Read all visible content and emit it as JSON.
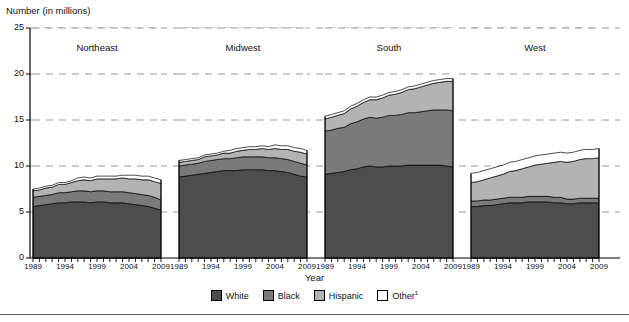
{
  "axes": {
    "ylabel": "Number (in millions)",
    "xlabel": "Year",
    "yticks": [
      "0",
      "5",
      "10",
      "15",
      "20",
      "25"
    ]
  },
  "legend": {
    "items": [
      {
        "label": "White",
        "color": "#4d4d4d",
        "sup": ""
      },
      {
        "label": "Black",
        "color": "#7a7a7a",
        "sup": ""
      },
      {
        "label": "Hispanic",
        "color": "#b3b3b3",
        "sup": ""
      },
      {
        "label": "Other",
        "color": "#ffffff",
        "sup": "1"
      }
    ]
  },
  "chart_data": {
    "type": "area",
    "title": "",
    "subtitle": "",
    "xlabel": "Year",
    "ylabel": "Number (in millions)",
    "ylim": [
      0,
      25
    ],
    "yticks": [
      0,
      5,
      10,
      15,
      20,
      25
    ],
    "grid": true,
    "grid_style": "dashed-horizontal",
    "legend_position": "bottom-center",
    "stacked": true,
    "series_order": [
      "White",
      "Black",
      "Hispanic",
      "Other"
    ],
    "x": [
      1989,
      1990,
      1991,
      1992,
      1993,
      1994,
      1995,
      1996,
      1997,
      1998,
      1999,
      2000,
      2001,
      2002,
      2003,
      2004,
      2005,
      2006,
      2007,
      2008,
      2009
    ],
    "xtick_labels": [
      "1989",
      "1994",
      "1999",
      "2004",
      "2009"
    ],
    "panels": [
      {
        "name": "Northeast",
        "series": [
          {
            "name": "White",
            "values": [
              5.6,
              5.7,
              5.8,
              5.9,
              6.0,
              6.0,
              6.1,
              6.1,
              6.1,
              6.0,
              6.1,
              6.1,
              6.0,
              6.0,
              6.0,
              5.9,
              5.8,
              5.7,
              5.6,
              5.4,
              5.2
            ]
          },
          {
            "name": "Black",
            "values": [
              1.0,
              1.0,
              1.0,
              1.0,
              1.1,
              1.1,
              1.1,
              1.2,
              1.2,
              1.2,
              1.2,
              1.2,
              1.2,
              1.2,
              1.2,
              1.2,
              1.2,
              1.2,
              1.2,
              1.2,
              1.1
            ]
          },
          {
            "name": "Hispanic",
            "values": [
              0.7,
              0.7,
              0.8,
              0.8,
              0.9,
              0.9,
              1.0,
              1.1,
              1.2,
              1.2,
              1.3,
              1.3,
              1.4,
              1.4,
              1.5,
              1.5,
              1.6,
              1.6,
              1.7,
              1.7,
              1.8
            ]
          },
          {
            "name": "Other",
            "values": [
              0.2,
              0.2,
              0.2,
              0.2,
              0.2,
              0.2,
              0.2,
              0.3,
              0.3,
              0.3,
              0.3,
              0.3,
              0.3,
              0.3,
              0.3,
              0.4,
              0.4,
              0.4,
              0.4,
              0.4,
              0.4
            ]
          }
        ],
        "totals": [
          7.5,
          7.6,
          7.8,
          7.9,
          8.2,
          8.2,
          8.4,
          8.7,
          8.8,
          8.7,
          8.9,
          8.9,
          8.9,
          8.9,
          9.0,
          9.0,
          9.0,
          8.9,
          8.9,
          8.7,
          8.5
        ]
      },
      {
        "name": "Midwest",
        "series": [
          {
            "name": "White",
            "values": [
              8.8,
              8.9,
              9.0,
              9.1,
              9.2,
              9.3,
              9.4,
              9.5,
              9.5,
              9.5,
              9.6,
              9.6,
              9.6,
              9.6,
              9.5,
              9.5,
              9.4,
              9.3,
              9.1,
              8.9,
              8.8
            ]
          },
          {
            "name": "Black",
            "values": [
              1.2,
              1.2,
              1.2,
              1.2,
              1.3,
              1.3,
              1.3,
              1.3,
              1.3,
              1.4,
              1.4,
              1.4,
              1.4,
              1.4,
              1.4,
              1.4,
              1.4,
              1.4,
              1.4,
              1.4,
              1.3
            ]
          },
          {
            "name": "Hispanic",
            "values": [
              0.4,
              0.4,
              0.4,
              0.4,
              0.5,
              0.5,
              0.5,
              0.6,
              0.6,
              0.7,
              0.7,
              0.8,
              0.8,
              0.9,
              0.9,
              1.0,
              1.0,
              1.1,
              1.1,
              1.2,
              1.2
            ]
          },
          {
            "name": "Other",
            "values": [
              0.2,
              0.2,
              0.2,
              0.2,
              0.2,
              0.2,
              0.2,
              0.2,
              0.3,
              0.3,
              0.3,
              0.3,
              0.3,
              0.3,
              0.3,
              0.4,
              0.4,
              0.4,
              0.4,
              0.4,
              0.4
            ]
          }
        ],
        "totals": [
          10.6,
          10.7,
          10.8,
          10.9,
          11.2,
          11.3,
          11.4,
          11.6,
          11.7,
          11.9,
          12.0,
          12.1,
          12.1,
          12.2,
          12.1,
          12.3,
          12.2,
          12.2,
          12.0,
          11.9,
          11.7
        ]
      },
      {
        "name": "South",
        "series": [
          {
            "name": "White",
            "values": [
              9.1,
              9.2,
              9.3,
              9.4,
              9.6,
              9.7,
              9.9,
              10.0,
              9.9,
              9.9,
              10.0,
              10.0,
              10.0,
              10.1,
              10.1,
              10.1,
              10.1,
              10.1,
              10.1,
              10.0,
              9.9
            ]
          },
          {
            "name": "Black",
            "values": [
              4.7,
              4.7,
              4.8,
              4.8,
              5.0,
              5.1,
              5.2,
              5.3,
              5.3,
              5.4,
              5.5,
              5.5,
              5.6,
              5.7,
              5.7,
              5.8,
              5.9,
              6.0,
              6.0,
              6.1,
              6.1
            ]
          },
          {
            "name": "Hispanic",
            "values": [
              1.3,
              1.4,
              1.4,
              1.5,
              1.6,
              1.7,
              1.8,
              1.9,
              2.0,
              2.1,
              2.2,
              2.3,
              2.4,
              2.5,
              2.6,
              2.7,
              2.8,
              2.9,
              3.0,
              3.1,
              3.2
            ]
          },
          {
            "name": "Other",
            "values": [
              0.3,
              0.3,
              0.3,
              0.3,
              0.3,
              0.3,
              0.3,
              0.3,
              0.3,
              0.3,
              0.3,
              0.3,
              0.3,
              0.3,
              0.3,
              0.3,
              0.3,
              0.3,
              0.3,
              0.3,
              0.3
            ]
          }
        ],
        "totals": [
          15.4,
          15.6,
          15.8,
          16.0,
          16.5,
          16.8,
          17.2,
          17.5,
          17.5,
          17.7,
          18.0,
          18.1,
          18.3,
          18.6,
          18.7,
          18.9,
          19.1,
          19.3,
          19.4,
          19.5,
          19.5
        ]
      },
      {
        "name": "West",
        "series": [
          {
            "name": "White",
            "values": [
              5.6,
              5.6,
              5.7,
              5.7,
              5.8,
              5.9,
              6.0,
              6.0,
              6.0,
              6.1,
              6.1,
              6.1,
              6.1,
              6.0,
              6.0,
              5.9,
              5.9,
              6.0,
              6.0,
              6.0,
              6.0
            ]
          },
          {
            "name": "Black",
            "values": [
              0.6,
              0.6,
              0.6,
              0.6,
              0.6,
              0.6,
              0.6,
              0.6,
              0.6,
              0.6,
              0.6,
              0.6,
              0.6,
              0.6,
              0.6,
              0.5,
              0.5,
              0.5,
              0.5,
              0.5,
              0.5
            ]
          },
          {
            "name": "Hispanic",
            "values": [
              2.0,
              2.1,
              2.2,
              2.4,
              2.5,
              2.6,
              2.8,
              2.9,
              3.1,
              3.2,
              3.4,
              3.5,
              3.6,
              3.8,
              3.9,
              4.0,
              4.1,
              4.2,
              4.3,
              4.3,
              4.4
            ]
          },
          {
            "name": "Other",
            "values": [
              1.0,
              1.0,
              1.0,
              1.0,
              1.0,
              1.0,
              1.0,
              1.0,
              1.0,
              1.0,
              1.0,
              1.0,
              1.0,
              1.0,
              1.0,
              1.0,
              1.0,
              1.0,
              1.0,
              1.0,
              1.0
            ]
          }
        ],
        "totals": [
          9.2,
          9.3,
          9.5,
          9.7,
          9.9,
          10.1,
          10.4,
          10.5,
          10.7,
          10.9,
          11.1,
          11.2,
          11.3,
          11.4,
          11.5,
          11.4,
          11.5,
          11.7,
          11.8,
          11.8,
          11.9
        ]
      }
    ]
  }
}
